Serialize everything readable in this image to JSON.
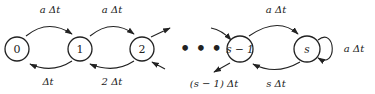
{
  "diagram": {
    "type": "birth-death state transition diagram",
    "nodes": [
      {
        "id": "0",
        "label": "0"
      },
      {
        "id": "1",
        "label": "1"
      },
      {
        "id": "2",
        "label": "2"
      },
      {
        "id": "s-1",
        "label": "s − 1"
      },
      {
        "id": "s",
        "label": "s"
      }
    ],
    "ellipsis": "• • •",
    "edges": [
      {
        "from": "0",
        "to": "1",
        "label": "a Δt"
      },
      {
        "from": "1",
        "to": "2",
        "label": "a Δt"
      },
      {
        "from": "1",
        "to": "0",
        "label": "Δt"
      },
      {
        "from": "2",
        "to": "1",
        "label": "2 Δt"
      },
      {
        "from": "s-1",
        "to": "s",
        "label": "a Δt"
      },
      {
        "from": "s",
        "to": "s-1",
        "label": "s Δt"
      },
      {
        "from": "s-1",
        "to": "…",
        "label": "(s − 1) Δt"
      },
      {
        "from": "s",
        "to": "s",
        "label": "a Δt"
      }
    ]
  }
}
